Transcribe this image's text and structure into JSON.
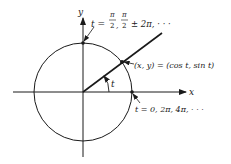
{
  "diagram": {
    "type": "unit-circle-parametrization",
    "axes": {
      "x_label": "x",
      "y_label": "y"
    },
    "angle_label": "t",
    "point_label": "(x, y) = (cos t, sin t)",
    "top_point_label_prefix": "t = ",
    "top_point_label_rest": "± 2π, · · ·",
    "top_point_fraction": {
      "numerator": "π",
      "denominator": "2"
    },
    "right_point_label": "t = 0, 2π, 4π, · · ·",
    "colors": {
      "stroke": "#1a1a1a",
      "background": "#ffffff"
    }
  }
}
